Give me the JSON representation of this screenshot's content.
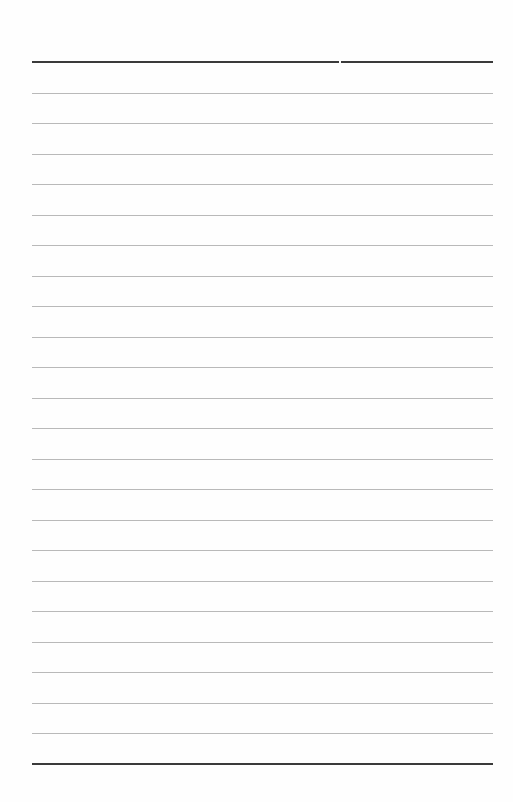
{
  "document": {
    "type": "blank lined writing sheet",
    "line_count": 24,
    "top_rule": {
      "style": "heavy",
      "segments": 2
    },
    "bottom_rule": {
      "style": "heavy"
    },
    "colors": {
      "heavy_rule": "#3a3a3a",
      "light_rule": "#b9b9b9",
      "paper": "#fefefe"
    }
  }
}
